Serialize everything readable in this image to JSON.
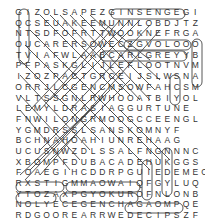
{
  "puzzle": {
    "type": "word-search",
    "rows": [
      "GIZOLSAPEZGINSENGEGI",
      "QCSEUAKEEMUNNLOBDJTZ",
      "NTSDFOFRTTWOOKNEFRGA",
      "OUCARERSOWECZGVOLOOO",
      "TVIAFWLAABCARLGREYYB",
      "PFPASKGLIJLEFLOOTNVM",
      "IZOZPACTGRCEIJSLWSNA",
      "ORRJLCGENCMSOWFAHCSM",
      "VLTSSGNLRWHOOATBIYOL",
      "LEMYLDRASIAGGURTUNE",
      "FNWILONGRMOOGCCEENGL",
      "YGMDRSSLSANSKOMNYF",
      "BCHNAHOAHIUNREHAAG",
      "UCUSNWZDLSSALFNGNNNC",
      "XBOMPFDUBACADEHUKGGS",
      "FOAEGIHCDDRPGUIEDEMEOEF",
      "RXSTIGMMAOWAIQFGYLUQ",
      "YTOZAXPGYOKUROFNLONB",
      "NOLYECEGENCHAGAOMPQE",
      "RDGOOREARRWEDECIPSZF"
    ],
    "found_words_visible": [
      "GINSENG",
      "EARL GREY",
      "OOLONG",
      "GYOKURO",
      "GENCHA",
      "DECIPS",
      "CEYLON",
      "TEA"
    ]
  }
}
